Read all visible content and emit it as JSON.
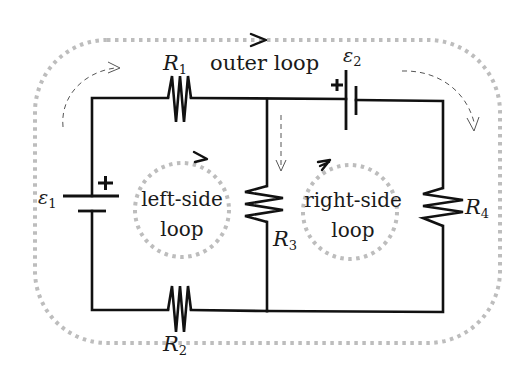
{
  "diagram": {
    "type": "circuit-schematic",
    "title_label": "outer loop",
    "loops": [
      {
        "id": "outer",
        "label": "outer loop"
      },
      {
        "id": "left",
        "label_line1": "left-side",
        "label_line2": "loop"
      },
      {
        "id": "right",
        "label_line1": "right-side",
        "label_line2": "loop"
      }
    ],
    "components": {
      "R1": {
        "symbol": "R",
        "subscript": "1",
        "kind": "resistor",
        "position": "top-left branch"
      },
      "R2": {
        "symbol": "R",
        "subscript": "2",
        "kind": "resistor",
        "position": "bottom-left branch"
      },
      "R3": {
        "symbol": "R",
        "subscript": "3",
        "kind": "resistor",
        "position": "middle branch"
      },
      "R4": {
        "symbol": "R",
        "subscript": "4",
        "kind": "resistor",
        "position": "right branch"
      },
      "E1": {
        "symbol": "ε",
        "subscript": "1",
        "kind": "battery",
        "polarity": "+",
        "position": "left branch"
      },
      "E2": {
        "symbol": "ε",
        "subscript": "2",
        "kind": "battery",
        "polarity": "+",
        "position": "top-right branch"
      }
    },
    "colors": {
      "wire": "#111111",
      "loop_path": "#bdbdbd",
      "dashed_current_arrow": "#555555",
      "background": "#ffffff"
    }
  }
}
